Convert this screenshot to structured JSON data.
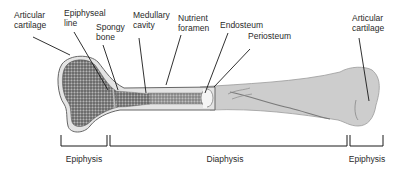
{
  "diagram": {
    "labels": [
      {
        "id": "articular-cartilage-left",
        "text": "Articular\ncartilage"
      },
      {
        "id": "epiphyseal-line",
        "text": "Epiphyseal\nline"
      },
      {
        "id": "spongy-bone",
        "text": "Spongy\nbone"
      },
      {
        "id": "medullary-cavity",
        "text": "Medullary\ncavity"
      },
      {
        "id": "nutrient-foramen",
        "text": "Nutrient\nforamen"
      },
      {
        "id": "endosteum",
        "text": "Endosteum"
      },
      {
        "id": "periosteum",
        "text": "Periosteum"
      },
      {
        "id": "articular-cartilage-right",
        "text": "Articular\ncartilage"
      }
    ],
    "regions": [
      {
        "id": "epiphysis-left",
        "text": "Epiphysis"
      },
      {
        "id": "diaphysis",
        "text": "Diaphysis"
      },
      {
        "id": "epiphysis-right",
        "text": "Epiphysis"
      }
    ],
    "colors": {
      "spongy": "#6e6e6e",
      "bone_surface": "#cfcfcf",
      "cartilage": "#e6e6e6",
      "outline": "#555555",
      "leader": "#1a1a1a"
    }
  }
}
